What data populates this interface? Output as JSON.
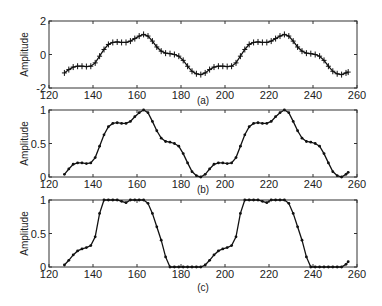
{
  "chart_data": [
    {
      "type": "line",
      "caption": "(a)",
      "ylabel": "Amplitude",
      "xlabel": "",
      "xlim": [
        120,
        260
      ],
      "ylim": [
        -2,
        2
      ],
      "xticks": [
        120,
        140,
        160,
        180,
        200,
        220,
        240,
        260
      ],
      "yticks": [
        -2,
        0,
        2
      ],
      "marker": "+",
      "x": [
        127,
        129,
        131,
        133,
        135,
        137,
        139,
        141,
        143,
        145,
        147,
        149,
        151,
        153,
        155,
        157,
        159,
        161,
        163,
        165,
        167,
        169,
        171,
        173,
        175,
        177,
        179,
        181,
        183,
        185,
        187,
        189,
        191,
        193,
        195,
        197,
        199,
        201,
        203,
        205,
        207,
        209,
        211,
        213,
        215,
        217,
        219,
        221,
        223,
        225,
        227,
        229,
        231,
        233,
        235,
        237,
        239,
        241,
        243,
        245,
        247,
        249,
        251,
        253,
        255,
        256
      ],
      "values": [
        -1.1,
        -0.9,
        -0.75,
        -0.7,
        -0.7,
        -0.72,
        -0.7,
        -0.5,
        -0.1,
        0.3,
        0.6,
        0.72,
        0.75,
        0.72,
        0.72,
        0.8,
        0.95,
        1.1,
        1.2,
        1.1,
        0.8,
        0.45,
        0.2,
        0.08,
        0.05,
        0.0,
        -0.1,
        -0.35,
        -0.7,
        -1.0,
        -1.15,
        -1.2,
        -1.1,
        -0.9,
        -0.75,
        -0.7,
        -0.7,
        -0.72,
        -0.7,
        -0.5,
        -0.1,
        0.3,
        0.6,
        0.72,
        0.75,
        0.72,
        0.72,
        0.8,
        0.95,
        1.1,
        1.2,
        1.1,
        0.8,
        0.45,
        0.2,
        0.08,
        0.05,
        0.0,
        -0.1,
        -0.35,
        -0.7,
        -1.0,
        -1.15,
        -1.2,
        -1.1,
        -1.05
      ]
    },
    {
      "type": "line",
      "caption": "(b)",
      "ylabel": "Amplitude",
      "xlabel": "",
      "xlim": [
        120,
        260
      ],
      "ylim": [
        0,
        1
      ],
      "xticks": [
        120,
        140,
        160,
        180,
        200,
        220,
        240,
        260
      ],
      "yticks": [
        0,
        0.5,
        1
      ],
      "marker": ".",
      "x": [
        127,
        129,
        131,
        133,
        135,
        137,
        139,
        141,
        143,
        145,
        147,
        149,
        151,
        153,
        155,
        157,
        159,
        161,
        163,
        165,
        167,
        169,
        171,
        173,
        175,
        177,
        179,
        181,
        183,
        185,
        187,
        189,
        191,
        193,
        195,
        197,
        199,
        201,
        203,
        205,
        207,
        209,
        211,
        213,
        215,
        217,
        219,
        221,
        223,
        225,
        227,
        229,
        231,
        233,
        235,
        237,
        239,
        241,
        243,
        245,
        247,
        249,
        251,
        253,
        255,
        256
      ],
      "values": [
        0.04,
        0.12,
        0.19,
        0.21,
        0.21,
        0.2,
        0.21,
        0.29,
        0.46,
        0.63,
        0.75,
        0.8,
        0.81,
        0.8,
        0.8,
        0.83,
        0.9,
        0.96,
        1.0,
        0.96,
        0.83,
        0.69,
        0.58,
        0.53,
        0.52,
        0.5,
        0.46,
        0.35,
        0.21,
        0.08,
        0.02,
        0.0,
        0.04,
        0.12,
        0.19,
        0.21,
        0.21,
        0.2,
        0.21,
        0.29,
        0.46,
        0.63,
        0.75,
        0.8,
        0.81,
        0.8,
        0.8,
        0.83,
        0.9,
        0.96,
        1.0,
        0.96,
        0.83,
        0.69,
        0.58,
        0.53,
        0.52,
        0.5,
        0.46,
        0.35,
        0.21,
        0.08,
        0.02,
        0.0,
        0.04,
        0.07
      ]
    },
    {
      "type": "line",
      "caption": "(c)",
      "ylabel": "Amplitude",
      "xlabel": "",
      "xlim": [
        120,
        260
      ],
      "ylim": [
        0,
        1
      ],
      "xticks": [
        120,
        140,
        160,
        180,
        200,
        220,
        240,
        260
      ],
      "yticks": [
        0,
        0.5,
        1
      ],
      "marker": ".",
      "x": [
        127,
        129,
        131,
        133,
        135,
        137,
        139,
        141,
        143,
        145,
        147,
        149,
        151,
        153,
        155,
        157,
        159,
        161,
        163,
        165,
        167,
        169,
        171,
        173,
        175,
        177,
        179,
        181,
        183,
        185,
        187,
        189,
        191,
        193,
        195,
        197,
        199,
        201,
        203,
        205,
        207,
        209,
        211,
        213,
        215,
        217,
        219,
        221,
        223,
        225,
        227,
        229,
        231,
        233,
        235,
        237,
        239,
        241,
        243,
        245,
        247,
        249,
        251,
        253,
        255,
        256
      ],
      "values": [
        0.03,
        0.1,
        0.18,
        0.24,
        0.27,
        0.29,
        0.32,
        0.45,
        0.8,
        1.0,
        1.0,
        1.0,
        1.0,
        0.98,
        0.96,
        1.0,
        1.0,
        1.0,
        1.0,
        0.95,
        0.8,
        0.6,
        0.4,
        0.15,
        0.0,
        0.0,
        0.0,
        0.0,
        0.0,
        0.0,
        0.0,
        0.0,
        0.03,
        0.1,
        0.18,
        0.24,
        0.27,
        0.29,
        0.32,
        0.45,
        0.8,
        1.0,
        1.0,
        1.0,
        1.0,
        0.98,
        0.96,
        1.0,
        1.0,
        1.0,
        1.0,
        0.95,
        0.8,
        0.6,
        0.4,
        0.15,
        0.0,
        0.0,
        0.0,
        0.0,
        0.0,
        0.0,
        0.0,
        0.0,
        0.04,
        0.08
      ]
    }
  ],
  "panels_layout": [
    {
      "left": 49,
      "right": 357,
      "top": 21,
      "bottom": 88
    },
    {
      "left": 49,
      "right": 357,
      "top": 110,
      "bottom": 177
    },
    {
      "left": 49,
      "right": 357,
      "top": 200,
      "bottom": 267
    }
  ],
  "colors": {
    "line": "#111111",
    "axes": "#333333"
  }
}
